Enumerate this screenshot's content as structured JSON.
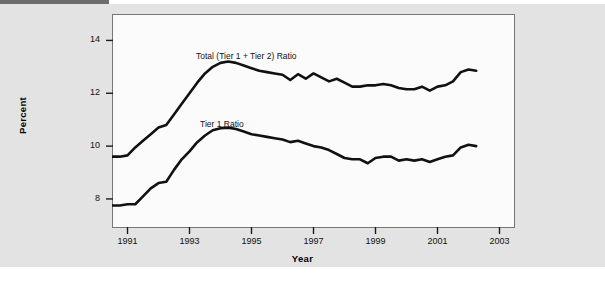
{
  "figure": {
    "background_color": "#e3e3e3",
    "plot_background_color": "#fbfbfb",
    "line_color": "#111111",
    "axis_color": "#767676"
  },
  "chart_data": {
    "type": "line",
    "title": "",
    "subtitle": "",
    "xlabel": "Year",
    "ylabel": "Percent",
    "xlim": [
      1990.5,
      2003.5
    ],
    "ylim": [
      6.9,
      15.0
    ],
    "xticks": [
      1991,
      1993,
      1995,
      1997,
      1999,
      2001,
      2003
    ],
    "xtick_labels": [
      "1991",
      "1993",
      "1995",
      "1997",
      "1999",
      "2001",
      "2003"
    ],
    "yticks": [
      8,
      10,
      12,
      14
    ],
    "ytick_labels": [
      "8",
      "10",
      "12",
      "14"
    ],
    "grid": false,
    "legend_position": "inline-annotations",
    "annotations": [
      {
        "text": "Total (Tier 1 + Tier 2) Ratio",
        "x": 1993.3,
        "y": 13.85
      },
      {
        "text": "Tier 1 Ratio",
        "x": 1993.5,
        "y": 11.1
      }
    ],
    "x": [
      1990.5,
      1990.75,
      1991.0,
      1991.25,
      1991.5,
      1991.75,
      1992.0,
      1992.25,
      1992.5,
      1992.75,
      1993.0,
      1993.25,
      1993.5,
      1993.75,
      1994.0,
      1994.25,
      1994.5,
      1994.75,
      1995.0,
      1995.25,
      1995.5,
      1995.75,
      1996.0,
      1996.25,
      1996.5,
      1996.75,
      1997.0,
      1997.25,
      1997.5,
      1997.75,
      1998.0,
      1998.25,
      1998.5,
      1998.75,
      1999.0,
      1999.25,
      1999.5,
      1999.75,
      2000.0,
      2000.25,
      2000.5,
      2000.75,
      2001.0,
      2001.25,
      2001.5,
      2001.75,
      2002.0,
      2002.25
    ],
    "series": [
      {
        "name": "Total (Tier 1 + Tier 2) Ratio",
        "values": [
          9.6,
          9.6,
          9.65,
          9.95,
          10.2,
          10.45,
          10.7,
          10.8,
          11.2,
          11.6,
          12.0,
          12.4,
          12.75,
          13.0,
          13.15,
          13.2,
          13.15,
          13.05,
          12.95,
          12.85,
          12.8,
          12.75,
          12.7,
          12.5,
          12.72,
          12.55,
          12.75,
          12.6,
          12.45,
          12.55,
          12.4,
          12.25,
          12.25,
          12.3,
          12.3,
          12.35,
          12.3,
          12.2,
          12.15,
          12.15,
          12.25,
          12.1,
          12.25,
          12.3,
          12.45,
          12.8,
          12.9,
          12.85
        ]
      },
      {
        "name": "Tier 1 Ratio",
        "values": [
          7.75,
          7.75,
          7.8,
          7.8,
          8.1,
          8.4,
          8.6,
          8.65,
          9.1,
          9.5,
          9.8,
          10.15,
          10.4,
          10.6,
          10.68,
          10.7,
          10.65,
          10.55,
          10.45,
          10.4,
          10.35,
          10.3,
          10.25,
          10.15,
          10.2,
          10.1,
          10.0,
          9.95,
          9.85,
          9.7,
          9.55,
          9.5,
          9.5,
          9.35,
          9.55,
          9.6,
          9.6,
          9.45,
          9.5,
          9.45,
          9.5,
          9.4,
          9.5,
          9.6,
          9.65,
          9.95,
          10.05,
          10.0
        ]
      }
    ]
  }
}
